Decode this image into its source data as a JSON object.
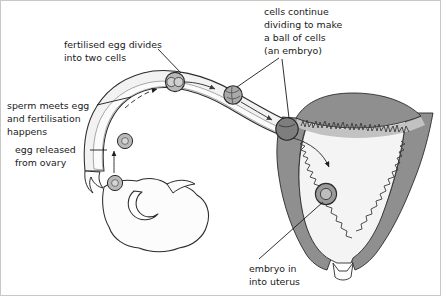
{
  "figure": {
    "background_color": "#ffffff",
    "border_color": "#c8c8c8"
  },
  "labels": {
    "fertilised_egg": {
      "name": "fertilised-egg-divides-label",
      "lines": [
        "fertilised egg divides",
        "into two cells"
      ]
    },
    "sperm_meets_egg": {
      "name": "sperm-meets-egg-label",
      "lines": [
        "sperm meets egg",
        "and fertilisation",
        "happens"
      ]
    },
    "egg_released": {
      "name": "egg-released-label",
      "lines": [
        "egg released",
        "from ovary"
      ]
    },
    "cells_continue": {
      "name": "cells-continue-dividing-label",
      "lines": [
        "cells continue",
        "dividing to make",
        "a ball of cells",
        "(an embryo)"
      ]
    },
    "embryo_in_uterus": {
      "name": "embryo-in-uterus-label",
      "lines": [
        "embryo in",
        "into uterus"
      ]
    }
  },
  "anatomy": {
    "ovary": "ovary",
    "fallopian_tube": "fallopian-tube",
    "uterus_wall": "uterus-muscular-wall",
    "uterus_cavity": "uterus-cavity",
    "endometrium": "endometrium-lining",
    "cervix": "cervix"
  },
  "stages": [
    {
      "id": "released-egg",
      "label": "egg released from ovary"
    },
    {
      "id": "fertilised-egg",
      "label": "sperm meets egg and fertilisation happens"
    },
    {
      "id": "two-cell-stage",
      "label": "fertilised egg divides into two cells"
    },
    {
      "id": "morula-stage",
      "label": "ball of cells dividing"
    },
    {
      "id": "blastocyst-stage",
      "label": "embryo entering uterus"
    },
    {
      "id": "implanted-embryo",
      "label": "embryo implanted in uterus lining"
    }
  ],
  "colors": {
    "outline": "#262626",
    "text": "#1a1a1a",
    "tube_fill": "#f2f2f2",
    "tube_lumen": "#fbfbfb",
    "uterus_wall": "#8f8f8f",
    "uterus_wall_dark": "#7a7a7a",
    "uterus_cavity": "#f4f4f4",
    "endometrium": "#b5b5b5",
    "cell_fill": "#b9b9b9",
    "blastocyst_fill": "#7e7e7e",
    "ovary_fill": "#fcfcfc"
  }
}
